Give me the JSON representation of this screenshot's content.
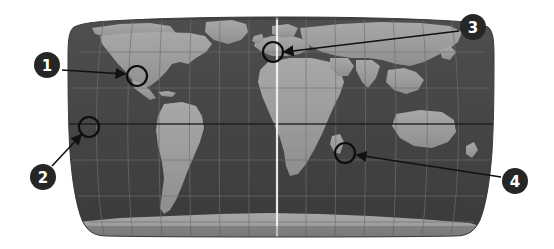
{
  "figure": {
    "width": 554,
    "height": 249,
    "background_color": "#ffffff"
  },
  "map": {
    "name": "world-map",
    "projection": "robinson",
    "style": "grayscale",
    "colors": {
      "ocean": "#4a4a4a",
      "ocean_dark": "#3d3d3d",
      "land": "#9a9a9a",
      "land_light": "#b0b0b0",
      "graticule": "#6a6a6a",
      "equator": "#1d1d1d",
      "meridian": "#f0f0f0",
      "edge": "#2e2e2e"
    },
    "bounds": {
      "left": 68,
      "right": 494,
      "top": 17,
      "bottom": 237,
      "center_x": 281,
      "center_y": 127
    },
    "graticule": {
      "meridian_count": 12,
      "parallel_count": 6,
      "equator_y": 124,
      "prime_meridian_x": 277
    }
  },
  "callouts": [
    {
      "id": 1,
      "label": "1",
      "badge": {
        "cx": 47,
        "cy": 65,
        "r": 13
      },
      "target": {
        "cx": 137,
        "cy": 76,
        "r": 10
      },
      "arrow": {
        "x1": 62,
        "y1": 70,
        "x2": 125,
        "y2": 74
      },
      "badge_fill": "#262626",
      "badge_text_color": "#ffffff",
      "region": "Central America / Caribbean"
    },
    {
      "id": 2,
      "label": "2",
      "badge": {
        "cx": 43,
        "cy": 177,
        "r": 13
      },
      "target": {
        "cx": 89,
        "cy": 127,
        "r": 10
      },
      "arrow": {
        "x1": 52,
        "y1": 166,
        "x2": 81,
        "y2": 135
      },
      "badge_fill": "#262626",
      "badge_text_color": "#ffffff",
      "region": "Eastern Pacific Ocean"
    },
    {
      "id": 3,
      "label": "3",
      "badge": {
        "cx": 473,
        "cy": 27,
        "r": 13
      },
      "target": {
        "cx": 273,
        "cy": 52,
        "r": 10
      },
      "arrow": {
        "x1": 459,
        "y1": 31,
        "x2": 284,
        "y2": 52
      },
      "badge_fill": "#262626",
      "badge_text_color": "#ffffff",
      "region": "Eastern Europe / Western Russia"
    },
    {
      "id": 4,
      "label": "4",
      "badge": {
        "cx": 515,
        "cy": 181,
        "r": 13
      },
      "target": {
        "cx": 345,
        "cy": 153,
        "r": 10
      },
      "arrow": {
        "x1": 501,
        "y1": 177,
        "x2": 357,
        "y2": 155
      },
      "badge_fill": "#262626",
      "badge_text_color": "#ffffff",
      "region": "Southern Africa / Indian Ocean"
    }
  ],
  "landmasses": [
    {
      "name": "north-america"
    },
    {
      "name": "south-america"
    },
    {
      "name": "greenland"
    },
    {
      "name": "europe"
    },
    {
      "name": "africa"
    },
    {
      "name": "asia"
    },
    {
      "name": "australia"
    },
    {
      "name": "antarctica"
    }
  ]
}
